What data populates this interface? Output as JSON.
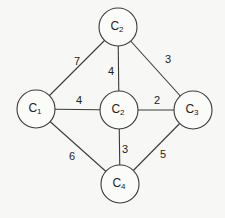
{
  "diagram": {
    "type": "weighted-undirected-graph",
    "nodes": [
      {
        "id": "n_top",
        "label": "C",
        "sub": "2",
        "x": 118,
        "y": 27,
        "r": 19
      },
      {
        "id": "n_left",
        "label": "C",
        "sub": "1",
        "x": 36,
        "y": 109,
        "r": 19
      },
      {
        "id": "n_mid",
        "label": "C",
        "sub": "2",
        "x": 119,
        "y": 110,
        "r": 19
      },
      {
        "id": "n_right",
        "label": "C",
        "sub": "3",
        "x": 193,
        "y": 110,
        "r": 19
      },
      {
        "id": "n_bot",
        "label": "C",
        "sub": "4",
        "x": 120,
        "y": 184,
        "r": 19
      }
    ],
    "edges": [
      {
        "from": "n_left",
        "to": "n_top",
        "weight": "7",
        "lx": 77,
        "ly": 62
      },
      {
        "from": "n_top",
        "to": "n_mid",
        "weight": "4",
        "lx": 111,
        "ly": 72
      },
      {
        "from": "n_top",
        "to": "n_right",
        "weight": "3",
        "lx": 168,
        "ly": 60
      },
      {
        "from": "n_left",
        "to": "n_mid",
        "weight": "4",
        "lx": 79,
        "ly": 101
      },
      {
        "from": "n_mid",
        "to": "n_right",
        "weight": "2",
        "lx": 157,
        "ly": 101
      },
      {
        "from": "n_left",
        "to": "n_bot",
        "weight": "6",
        "lx": 72,
        "ly": 157
      },
      {
        "from": "n_mid",
        "to": "n_bot",
        "weight": "3",
        "lx": 125,
        "ly": 150
      },
      {
        "from": "n_right",
        "to": "n_bot",
        "weight": "5",
        "lx": 163,
        "ly": 155
      }
    ]
  },
  "colors": {
    "background": "#f7f7f5",
    "stroke": "#3a3a3a",
    "text": "#222222"
  }
}
